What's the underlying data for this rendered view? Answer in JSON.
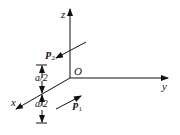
{
  "diagram": {
    "axes": {
      "x_label": "x",
      "y_label": "y",
      "z_label": "z",
      "origin_label": "O"
    },
    "dipoles": [
      {
        "label": "p",
        "subscript": "2"
      },
      {
        "label": "p",
        "subscript": "1"
      }
    ],
    "dimensions": [
      {
        "label": "a/2"
      },
      {
        "label": "a/2"
      }
    ],
    "colors": {
      "stroke": "#111111",
      "background": "#ffffff"
    }
  }
}
